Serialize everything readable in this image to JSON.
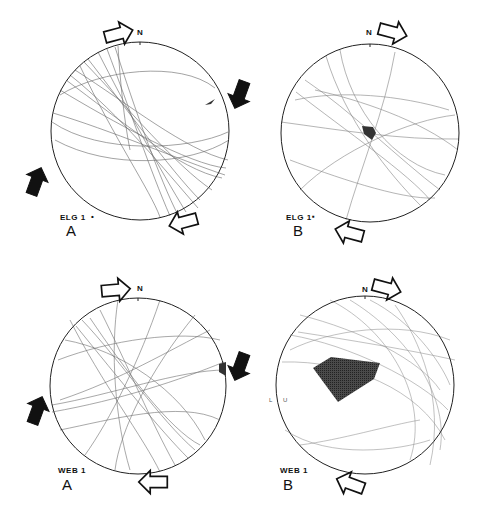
{
  "figure": {
    "type": "stereonet-fault-plane-plots",
    "background": "#ffffff",
    "line_color": "#2a2a2a",
    "fill_color": "#3a3a3a"
  },
  "panels": [
    {
      "id": "elg1-a",
      "site": "ELG 1",
      "marker": "•",
      "letter": "A",
      "north": "N",
      "center": [
        140,
        131
      ],
      "radius": 89,
      "arrows": [
        {
          "kind": "open",
          "role": "compression",
          "x": 118,
          "y": 34,
          "angle": -15
        },
        {
          "kind": "open",
          "role": "compression",
          "x": 184,
          "y": 222,
          "angle": 165
        },
        {
          "kind": "solid",
          "role": "extension",
          "x": 240,
          "y": 94,
          "angle": 110
        },
        {
          "kind": "solid",
          "role": "extension",
          "x": 36,
          "y": 182,
          "angle": -70
        }
      ],
      "fill_region": "small-wedge-east"
    },
    {
      "id": "elg1-b",
      "site": "ELG 1",
      "marker": "▪",
      "letter": "B",
      "north": "N",
      "center": [
        370,
        133
      ],
      "radius": 89,
      "arrows": [
        {
          "kind": "open",
          "role": "compression",
          "x": 392,
          "y": 32,
          "angle": 15
        },
        {
          "kind": "open",
          "role": "compression",
          "x": 350,
          "y": 233,
          "angle": 195
        }
      ],
      "fill_region": "small-central-polygon"
    },
    {
      "id": "web1-a",
      "site": "WEB 1",
      "marker": "",
      "letter": "A",
      "north": "N",
      "center": [
        138,
        386
      ],
      "radius": 88,
      "arrows": [
        {
          "kind": "open",
          "role": "compression",
          "x": 115,
          "y": 290,
          "angle": -5
        },
        {
          "kind": "open",
          "role": "compression",
          "x": 154,
          "y": 482,
          "angle": 180
        },
        {
          "kind": "solid",
          "role": "extension",
          "x": 240,
          "y": 366,
          "angle": 110
        },
        {
          "kind": "solid",
          "role": "extension",
          "x": 37,
          "y": 411,
          "angle": -70
        }
      ],
      "fill_region": "small-wedge-east"
    },
    {
      "id": "web1-b",
      "site": "WEB 1",
      "marker": "",
      "letter": "B",
      "north": "N",
      "center": [
        365,
        385
      ],
      "radius": 89,
      "side_labels": [
        "L",
        "U"
      ],
      "arrows": [
        {
          "kind": "open",
          "role": "compression",
          "x": 386,
          "y": 288,
          "angle": 15
        },
        {
          "kind": "open",
          "role": "compression",
          "x": 351,
          "y": 484,
          "angle": 200
        }
      ],
      "fill_region": "large-polygon-west"
    }
  ]
}
